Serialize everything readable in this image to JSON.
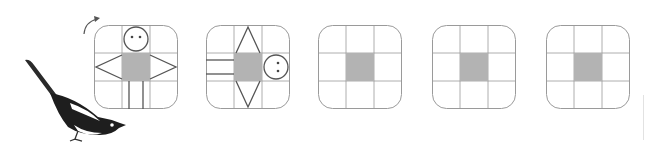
{
  "puzzle": {
    "description": "Rotation sequence: figure in a 3x3 grid rotated 90 degrees clockwise each step",
    "rotation_arrow": "clockwise-arrow",
    "panels": [
      {
        "index": 1,
        "content": "stick-figure-upright",
        "rotation_deg": 0
      },
      {
        "index": 2,
        "content": "stick-figure-rotated",
        "rotation_deg": 90
      },
      {
        "index": 3,
        "content": "empty-grid-center-shaded"
      },
      {
        "index": 4,
        "content": "empty-grid-center-shaded"
      },
      {
        "index": 5,
        "content": "empty-grid-center-shaded"
      }
    ]
  },
  "colors": {
    "grid_line": "#9a9a9a",
    "figure_line": "#555555",
    "shade": "#b3b3b3",
    "bird_dark": "#1e1e1e"
  }
}
